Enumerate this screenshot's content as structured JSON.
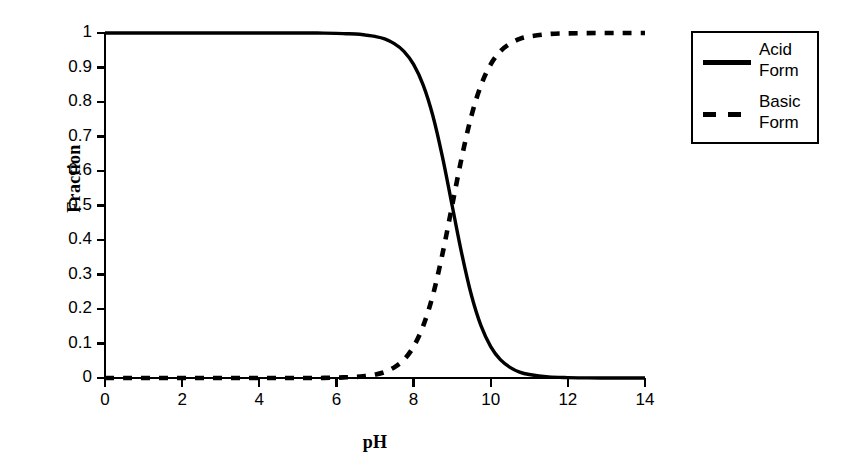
{
  "chart_data": {
    "type": "line",
    "title": "",
    "subtitle": "",
    "xlabel": "pH",
    "ylabel": "Fraction",
    "xlim": [
      0,
      14
    ],
    "ylim": [
      0,
      1
    ],
    "xticks": [
      "0",
      "2",
      "4",
      "6",
      "8",
      "10",
      "12",
      "14"
    ],
    "xtick_values": [
      0,
      2,
      4,
      6,
      8,
      10,
      12,
      14
    ],
    "yticks": [
      "0",
      "0.1",
      "0.2",
      "0.3",
      "0.4",
      "0.5",
      "0.6",
      "0.7",
      "0.8",
      "0.9",
      "1"
    ],
    "ytick_values": [
      0,
      0.1,
      0.2,
      0.3,
      0.4,
      0.5,
      0.6,
      0.7,
      0.8,
      0.9,
      1
    ],
    "grid": false,
    "legend_position": "outside-top-right",
    "pKa": 9.0,
    "x": [
      0,
      0.5,
      1,
      1.5,
      2,
      2.5,
      3,
      3.5,
      4,
      4.5,
      5,
      5.5,
      6,
      6.25,
      6.5,
      6.75,
      7,
      7.25,
      7.5,
      7.75,
      8,
      8.25,
      8.5,
      8.75,
      9,
      9.25,
      9.5,
      9.75,
      10,
      10.25,
      10.5,
      10.75,
      11,
      11.5,
      12,
      12.5,
      13,
      13.5,
      14
    ],
    "series": [
      {
        "name": "Acid Form",
        "label_line1": "Acid",
        "label_line2": "Form",
        "style": "solid",
        "color": "#000000",
        "values": [
          1,
          1,
          1,
          1,
          1,
          1,
          1,
          1,
          1,
          1,
          1,
          1,
          0.999,
          0.998,
          0.997,
          0.994,
          0.99,
          0.983,
          0.969,
          0.947,
          0.909,
          0.849,
          0.76,
          0.64,
          0.5,
          0.36,
          0.24,
          0.151,
          0.091,
          0.053,
          0.031,
          0.017,
          0.01,
          0.0031,
          0.001,
          0.0003,
          0.0001,
          3e-05,
          1e-05
        ]
      },
      {
        "name": "Basic Form",
        "label_line1": "Basic",
        "label_line2": "Form",
        "style": "dashed",
        "color": "#000000",
        "values": [
          0,
          0,
          0,
          0,
          0,
          0,
          0,
          0,
          0,
          0,
          0,
          0,
          0.001,
          0.002,
          0.003,
          0.006,
          0.01,
          0.017,
          0.031,
          0.053,
          0.091,
          0.151,
          0.24,
          0.36,
          0.5,
          0.64,
          0.76,
          0.849,
          0.909,
          0.947,
          0.969,
          0.983,
          0.99,
          0.9969,
          0.999,
          0.9997,
          0.9999,
          0.99997,
          0.99999
        ]
      }
    ]
  },
  "legend": {
    "entries": [
      {
        "line1": "Acid",
        "line2": "Form",
        "style": "solid"
      },
      {
        "line1": "Basic",
        "line2": "Form",
        "style": "dashed"
      }
    ]
  },
  "colors": {
    "axis": "#000000",
    "curve": "#000000",
    "background": "#ffffff"
  }
}
